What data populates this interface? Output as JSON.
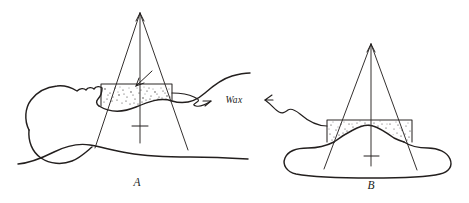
{
  "figure": {
    "background_color": "#ffffff",
    "ink_color": "#231f1e",
    "panels": [
      {
        "id": "A",
        "label": "A",
        "label_x": 137,
        "label_y": 186,
        "description": "Lateral view of a reclined head and neck with an angled wax bolus block under a diverging radiation beam",
        "apex": {
          "x": 140,
          "y": 13
        },
        "beam_left_end": {
          "x": 95,
          "y": 148
        },
        "beam_right_end": {
          "x": 188,
          "y": 150
        },
        "central_axis_end": {
          "x": 140,
          "y": 143
        },
        "bolus_box": {
          "x": 101,
          "y": 84,
          "width": 71,
          "height": 22
        }
      },
      {
        "id": "B",
        "label": "B",
        "label_x": 371,
        "label_y": 189,
        "description": "Cross-sectional view of a body contour with a flat-topped wax bolus block under a diverging radiation beam",
        "apex": {
          "x": 371,
          "y": 44
        },
        "beam_left_end": {
          "x": 324,
          "y": 169
        },
        "beam_right_end": {
          "x": 417,
          "y": 170
        },
        "central_axis_end": {
          "x": 371,
          "y": 166
        },
        "bolus_box": {
          "x": 327,
          "y": 120,
          "width": 85,
          "height": 22
        }
      }
    ],
    "annotation": {
      "text": "Wax",
      "x": 234,
      "y": 103,
      "leaders": [
        {
          "name": "leader-from-panel-a",
          "direction": "right",
          "arrowhead": "right"
        },
        {
          "name": "leader-from-panel-b",
          "direction": "left",
          "arrowhead": "left"
        }
      ]
    },
    "stipple": {
      "description": "Random dot shading representing wax bolus material",
      "dot_color": "#2b2726"
    }
  }
}
